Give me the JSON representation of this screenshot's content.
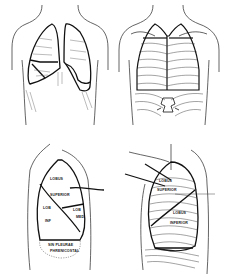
{
  "figure": {
    "panels": [
      {
        "id": "anterior-view",
        "description": "Anterior view of thorax with lung outlines"
      },
      {
        "id": "posterior-view",
        "description": "Posterior view of thorax with ribs, spine and lung outlines"
      },
      {
        "id": "right-lateral-view",
        "description": "Lateral view of lung lobes",
        "labels": {
          "lobus": "LOBUS",
          "superior": "SUPERIOR",
          "lob_inf_1": "LOB",
          "lob_inf_2": "INF",
          "lob_med_1": "LOB",
          "lob_med_2": "MED",
          "sinus_1": "SIN PLEURAE",
          "sinus_2": "PHRENICOSTAL"
        }
      },
      {
        "id": "left-lateral-view",
        "description": "Lateral view with ribs and lobes",
        "labels": {
          "lobus_sup_1": "LOBUS",
          "lobus_sup_2": "SUPERIOR",
          "lobus_inf_1": "LOBUS",
          "lobus_inf_2": "INFERIOR"
        }
      }
    ],
    "colors": {
      "ink": "#1a1a1a",
      "background": "#ffffff"
    }
  }
}
